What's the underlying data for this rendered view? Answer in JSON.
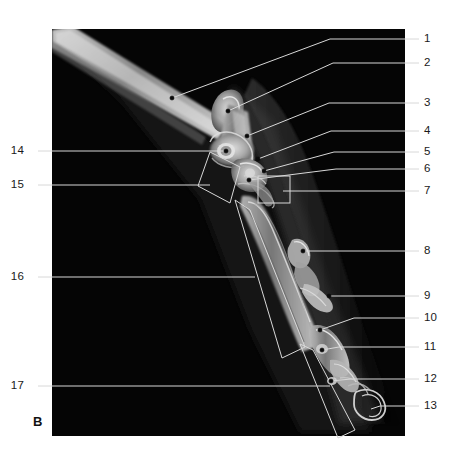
{
  "figure": {
    "panel_letter": "B",
    "modality": "radiograph",
    "plate": {
      "x": 52,
      "y": 29,
      "width": 353,
      "height": 407,
      "background_color": "#050505",
      "page_background": "#ffffff"
    },
    "leader_color": "#d8d8d8",
    "label_color": "#1a1a1a"
  },
  "labels": {
    "right": [
      {
        "id": "1",
        "text": "1",
        "x": 424,
        "y": 39,
        "tick_x1": 405,
        "tick_x2": 419
      },
      {
        "id": "2",
        "text": "2",
        "x": 424,
        "y": 63,
        "tick_x1": 405,
        "tick_x2": 419
      },
      {
        "id": "3",
        "text": "3",
        "x": 424,
        "y": 103,
        "tick_x1": 405,
        "tick_x2": 419
      },
      {
        "id": "4",
        "text": "4",
        "x": 424,
        "y": 131,
        "tick_x1": 405,
        "tick_x2": 419
      },
      {
        "id": "5",
        "text": "5",
        "x": 424,
        "y": 152,
        "tick_x1": 405,
        "tick_x2": 419
      },
      {
        "id": "6",
        "text": "6",
        "x": 424,
        "y": 169,
        "tick_x1": 405,
        "tick_x2": 419
      },
      {
        "id": "7",
        "text": "7",
        "x": 424,
        "y": 191,
        "tick_x1": 405,
        "tick_x2": 419
      },
      {
        "id": "8",
        "text": "8",
        "x": 424,
        "y": 251,
        "tick_x1": 405,
        "tick_x2": 419
      },
      {
        "id": "9",
        "text": "9",
        "x": 424,
        "y": 296,
        "tick_x1": 405,
        "tick_x2": 419
      },
      {
        "id": "10",
        "text": "10",
        "x": 424,
        "y": 318,
        "tick_x1": 405,
        "tick_x2": 419
      },
      {
        "id": "11",
        "text": "11",
        "x": 424,
        "y": 347,
        "tick_x1": 405,
        "tick_x2": 419
      },
      {
        "id": "12",
        "text": "12",
        "x": 424,
        "y": 379,
        "tick_x1": 405,
        "tick_x2": 419
      },
      {
        "id": "13",
        "text": "13",
        "x": 424,
        "y": 406,
        "tick_x1": 405,
        "tick_x2": 419
      }
    ],
    "left": [
      {
        "id": "14",
        "text": "14",
        "x": 24,
        "y": 151,
        "tick_x1": 38,
        "tick_x2": 52
      },
      {
        "id": "15",
        "text": "15",
        "x": 24,
        "y": 185,
        "tick_x1": 38,
        "tick_x2": 52
      },
      {
        "id": "16",
        "text": "16",
        "x": 24,
        "y": 277,
        "tick_x1": 38,
        "tick_x2": 52
      },
      {
        "id": "17",
        "text": "17",
        "x": 24,
        "y": 386,
        "tick_x1": 38,
        "tick_x2": 52
      }
    ]
  },
  "leaders": [
    {
      "id": "1",
      "points": "405,39 330,39 172,98",
      "dot": [
        172,
        98
      ]
    },
    {
      "id": "2",
      "points": "405,63 333,63 228,111",
      "dot": [
        228,
        111
      ]
    },
    {
      "id": "3",
      "points": "405,103 329,103 247,136",
      "dot": [
        247,
        136
      ]
    },
    {
      "id": "4",
      "points": "405,131 331,131 258,159",
      "dot": [
        258,
        159
      ]
    },
    {
      "id": "5",
      "points": "405,152 334,152 264,171",
      "dot": [
        264,
        171
      ]
    },
    {
      "id": "6",
      "points": "405,169 336,169 249,180",
      "dot": [
        249,
        180
      ]
    },
    {
      "id": "7",
      "points": "405,191 283,191",
      "dot": null
    },
    {
      "id": "8",
      "points": "405,251 303,251",
      "dot": [
        303,
        251
      ]
    },
    {
      "id": "9",
      "points": "405,296 329,296",
      "dot": [
        329,
        296
      ]
    },
    {
      "id": "10",
      "points": "405,318 354,318 320,330",
      "dot": [
        320,
        330
      ]
    },
    {
      "id": "11",
      "points": "405,347 339,347 322,350",
      "dot": [
        322,
        350
      ]
    },
    {
      "id": "12",
      "points": "405,379 351,379 331,381",
      "dot": [
        331,
        381
      ]
    },
    {
      "id": "13",
      "points": "405,406 380,406 371,409",
      "dot": null
    },
    {
      "id": "14",
      "points": "52,151 226,151",
      "dot": [
        226,
        151
      ]
    },
    {
      "id": "15",
      "points": "52,185 210,185",
      "dot": null
    },
    {
      "id": "16",
      "points": "52,277 255,277",
      "dot": null
    },
    {
      "id": "17",
      "points": "52,386 330,386",
      "dot": null
    }
  ],
  "brackets": [
    {
      "id": "15",
      "shape": "quad",
      "points": "210,152 240,167 230,203 198,186"
    },
    {
      "id": "16",
      "shape": "quad",
      "points": "235,200 250,210 305,347 282,358"
    },
    {
      "id": "17",
      "shape": "quad",
      "points": "300,344 313,350 355,430 338,438"
    }
  ],
  "boxes": [
    {
      "id": "7",
      "x": 258,
      "y": 176,
      "width": 32,
      "height": 27
    }
  ],
  "anatomy": {
    "limb_shaft": "radius and ulna shaft descending from upper left",
    "joint": "antebrachiocarpal / carpal joint",
    "distal": "metacarpal bones, proximal / middle / distal phalanges, sesamoids, ungual process"
  }
}
